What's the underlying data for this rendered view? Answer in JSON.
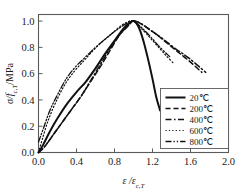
{
  "chart_data": {
    "type": "line",
    "title": "",
    "xlabel": "ε /ε",
    "xlabel_sub": "c,T",
    "ylabel": "σ/f",
    "ylabel_sub": "c,T",
    "ylabel_tail": "/MPa",
    "xlim": [
      0.0,
      2.0
    ],
    "ylim": [
      0.0,
      1.05
    ],
    "xticks": [
      "0.0",
      "0.4",
      "0.8",
      "1.2",
      "1.6",
      "2.0"
    ],
    "xtick_values": [
      0.0,
      0.4,
      0.8,
      1.2,
      1.6,
      2.0
    ],
    "yticks": [
      "0.0",
      "0.2",
      "0.4",
      "0.6",
      "0.8",
      "1.0"
    ],
    "ytick_values": [
      0.0,
      0.2,
      0.4,
      0.6,
      0.8,
      1.0
    ],
    "grid": false,
    "legend_position": "lower-right-inside",
    "series": [
      {
        "name": "20℃",
        "style": "solid",
        "width": 2.0,
        "dash": "none",
        "x": [
          0.0,
          0.05,
          0.12,
          0.2,
          0.3,
          0.4,
          0.5,
          0.6,
          0.7,
          0.78,
          0.86,
          0.93,
          1.0,
          1.05,
          1.1,
          1.15,
          1.2,
          1.24,
          1.28
        ],
        "y": [
          0.0,
          0.06,
          0.16,
          0.26,
          0.37,
          0.46,
          0.54,
          0.64,
          0.75,
          0.83,
          0.91,
          0.97,
          1.0,
          0.96,
          0.86,
          0.72,
          0.56,
          0.42,
          0.32
        ]
      },
      {
        "name": "200℃",
        "style": "dashed",
        "width": 1.5,
        "dash": "5,3",
        "x": [
          0.0,
          0.06,
          0.14,
          0.24,
          0.34,
          0.44,
          0.54,
          0.64,
          0.74,
          0.84,
          0.92,
          1.0,
          1.1,
          1.22,
          1.34,
          1.46,
          1.58,
          1.72
        ],
        "y": [
          0.0,
          0.04,
          0.12,
          0.22,
          0.32,
          0.42,
          0.53,
          0.64,
          0.76,
          0.88,
          0.95,
          1.0,
          0.97,
          0.91,
          0.84,
          0.77,
          0.7,
          0.61
        ]
      },
      {
        "name": "400℃",
        "style": "dash-dot",
        "width": 1.5,
        "dash": "6,2.5,1.5,2.5",
        "x": [
          0.0,
          0.07,
          0.16,
          0.26,
          0.36,
          0.46,
          0.56,
          0.66,
          0.76,
          0.86,
          0.94,
          1.0,
          1.08,
          1.18,
          1.3,
          1.44,
          1.58,
          1.76
        ],
        "y": [
          0.0,
          0.05,
          0.14,
          0.24,
          0.34,
          0.44,
          0.56,
          0.68,
          0.8,
          0.9,
          0.96,
          1.0,
          0.98,
          0.93,
          0.87,
          0.79,
          0.72,
          0.61
        ]
      },
      {
        "name": "600℃",
        "style": "dotted",
        "width": 1.2,
        "dash": "1.2,2.2",
        "x": [
          0.0,
          0.04,
          0.1,
          0.18,
          0.28,
          0.38,
          0.48,
          0.58,
          0.68,
          0.78,
          0.88,
          0.96,
          1.0,
          1.06,
          1.14,
          1.24,
          1.34,
          1.42
        ],
        "y": [
          0.0,
          0.1,
          0.24,
          0.38,
          0.52,
          0.62,
          0.7,
          0.78,
          0.85,
          0.91,
          0.97,
          1.0,
          1.0,
          0.96,
          0.9,
          0.82,
          0.74,
          0.68
        ]
      },
      {
        "name": "800℃",
        "style": "dash-dot-dot",
        "width": 1.3,
        "dash": "6,2,1.3,2,1.3,2",
        "x": [
          0.0,
          0.05,
          0.12,
          0.2,
          0.3,
          0.4,
          0.5,
          0.6,
          0.7,
          0.8,
          0.9,
          0.97,
          1.02,
          1.1,
          1.18,
          1.28,
          1.38
        ],
        "y": [
          0.08,
          0.18,
          0.32,
          0.44,
          0.57,
          0.66,
          0.73,
          0.8,
          0.86,
          0.92,
          0.97,
          1.0,
          0.99,
          0.94,
          0.88,
          0.8,
          0.73
        ]
      }
    ]
  },
  "legend": {
    "items": [
      {
        "label": "20℃"
      },
      {
        "label": "200℃"
      },
      {
        "label": "400℃"
      },
      {
        "label": "600℃"
      },
      {
        "label": "800℃"
      }
    ]
  }
}
